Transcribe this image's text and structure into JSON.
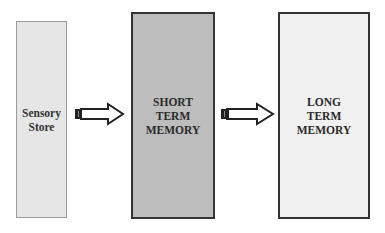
{
  "diagram": {
    "type": "flow",
    "direction": "left-to-right",
    "nodes": [
      {
        "id": "sensory",
        "label": "Sensory\nStore",
        "fill": "#e6e6e6",
        "border": "#9a9a9a"
      },
      {
        "id": "stm",
        "label": "SHORT\nTERM\nMEMORY",
        "fill": "#bdbdbd",
        "border": "#333333"
      },
      {
        "id": "ltm",
        "label": "LONG\nTERM\nMEMORY",
        "fill": "#f1f1f1",
        "border": "#333333"
      }
    ],
    "edges": [
      {
        "from": "sensory",
        "to": "stm",
        "style": "hollow-block-arrow"
      },
      {
        "from": "stm",
        "to": "ltm",
        "style": "hollow-block-arrow"
      }
    ]
  },
  "colors": {
    "arrow_outline": "#222222",
    "arrow_fill": "#ffffff",
    "text": "#2a2a2a"
  }
}
